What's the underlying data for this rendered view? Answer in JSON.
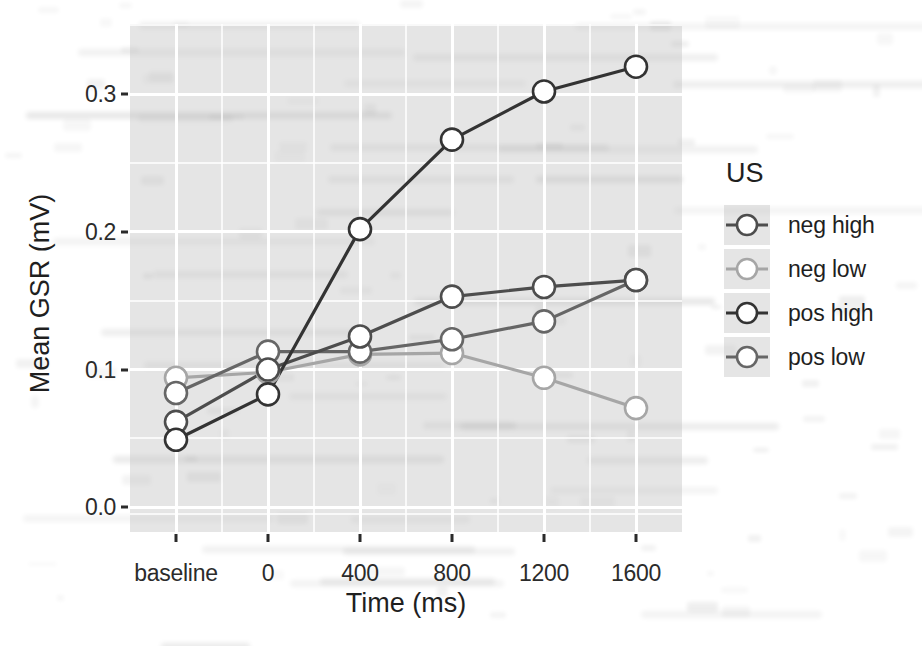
{
  "figure": {
    "background_tint": "#bebebe",
    "point_fill": "#ffffff"
  },
  "legend": {
    "title": "US",
    "items": [
      {
        "label": "neg high",
        "color": "#4d4d4d"
      },
      {
        "label": "neg low",
        "color": "#a6a6a6"
      },
      {
        "label": "pos high",
        "color": "#333333"
      },
      {
        "label": "pos low",
        "color": "#666666"
      }
    ]
  },
  "chart_data": {
    "type": "line",
    "title": "",
    "xlabel": "Time (ms)",
    "ylabel": "Mean GSR (mV)",
    "categories": [
      "baseline",
      "0",
      "400",
      "800",
      "1200",
      "1600"
    ],
    "x_tick_labels": [
      "baseline",
      "0",
      "400",
      "800",
      "1200",
      "1600"
    ],
    "y_tick_labels": [
      "0.0",
      "0.1",
      "0.2",
      "0.3"
    ],
    "y_ticks": [
      0.0,
      0.1,
      0.2,
      0.3
    ],
    "ylim": [
      -0.018,
      0.351
    ],
    "grid": true,
    "legend_position": "right",
    "legend_title": "US",
    "series": [
      {
        "name": "neg high",
        "color": "#4d4d4d",
        "values": [
          0.062,
          0.1,
          0.124,
          0.153,
          0.16,
          0.165
        ]
      },
      {
        "name": "neg low",
        "color": "#a6a6a6",
        "values": [
          0.094,
          0.098,
          0.111,
          0.112,
          0.094,
          0.072
        ]
      },
      {
        "name": "pos high",
        "color": "#333333",
        "values": [
          0.049,
          0.082,
          0.202,
          0.267,
          0.302,
          0.32
        ]
      },
      {
        "name": "pos low",
        "color": "#666666",
        "values": [
          0.083,
          0.113,
          0.113,
          0.122,
          0.135,
          0.165
        ]
      }
    ]
  }
}
